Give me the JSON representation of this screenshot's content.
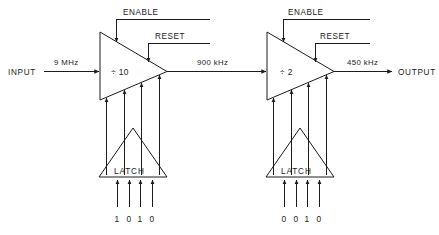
{
  "diagram": {
    "type": "block-diagram",
    "canvas": {
      "width": 439,
      "height": 235
    },
    "colors": {
      "background": "#ffffff",
      "line": "#1c1c1c",
      "text": "#1c1c1c"
    },
    "terminals": {
      "input_label": "INPUT",
      "output_label": "OUTPUT"
    },
    "signals": {
      "input_freq": "9 MHz",
      "inter_freq": "900 kHz",
      "output_freq": "450 kHz"
    },
    "stages": [
      {
        "id": "stage-1",
        "divider_label": "÷ 10",
        "enable_label": "ENABLE",
        "reset_label": "RESET",
        "latch_label": "LATCH",
        "latch_bits": [
          "1",
          "0",
          "1",
          "0"
        ],
        "input_freq": "9 MHz",
        "output_freq": "900 kHz",
        "divide_ratio": 10
      },
      {
        "id": "stage-2",
        "divider_label": "÷ 2",
        "enable_label": "ENABLE",
        "reset_label": "RESET",
        "latch_label": "LATCH",
        "latch_bits": [
          "0",
          "0",
          "1",
          "0"
        ],
        "input_freq": "900 kHz",
        "output_freq": "450 kHz",
        "divide_ratio": 2
      }
    ]
  }
}
